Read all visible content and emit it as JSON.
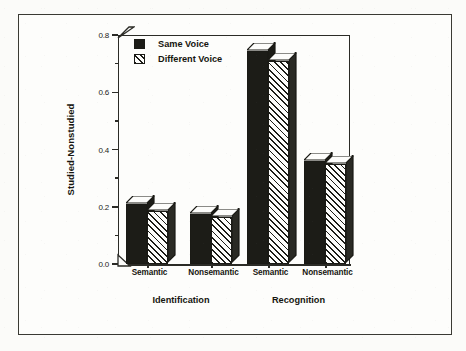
{
  "chart_data": {
    "type": "bar",
    "title": "",
    "xlabel": "",
    "ylabel": "Studied-Nonstudied",
    "ylim": [
      0.0,
      0.8
    ],
    "ytick_labels": [
      "0.0",
      "0.2",
      "0.4",
      "0.6",
      "0.8"
    ],
    "ytick_values": [
      0.0,
      0.2,
      0.4,
      0.6,
      0.8
    ],
    "minor_ticks": [
      0.1,
      0.3,
      0.5,
      0.7
    ],
    "grid": false,
    "legend_position": "top-left-inside",
    "groups": [
      "Identification",
      "Recognition"
    ],
    "categories": [
      "Semantic",
      "Nonsemantic",
      "Semantic",
      "Nonsemantic"
    ],
    "series": [
      {
        "name": "Same Voice",
        "fill": "solid-black",
        "values": [
          0.21,
          0.175,
          0.745,
          0.36
        ]
      },
      {
        "name": "Different Voice",
        "fill": "diagonal-hatch",
        "values": [
          0.185,
          0.165,
          0.71,
          0.35
        ]
      }
    ],
    "bars": [
      {
        "group": "Identification",
        "category": "Semantic",
        "series": "Same Voice",
        "value": 0.21
      },
      {
        "group": "Identification",
        "category": "Semantic",
        "series": "Different Voice",
        "value": 0.185
      },
      {
        "group": "Identification",
        "category": "Nonsemantic",
        "series": "Same Voice",
        "value": 0.175
      },
      {
        "group": "Identification",
        "category": "Nonsemantic",
        "series": "Different Voice",
        "value": 0.165
      },
      {
        "group": "Recognition",
        "category": "Semantic",
        "series": "Same Voice",
        "value": 0.745
      },
      {
        "group": "Recognition",
        "category": "Semantic",
        "series": "Different Voice",
        "value": 0.71
      },
      {
        "group": "Recognition",
        "category": "Nonsemantic",
        "series": "Same Voice",
        "value": 0.36
      },
      {
        "group": "Recognition",
        "category": "Nonsemantic",
        "series": "Different Voice",
        "value": 0.35
      }
    ]
  },
  "axis": {
    "y_title": "Studied-Nonstudied",
    "ticks": [
      {
        "label": "0.8",
        "value": 0.8
      },
      {
        "label": "0.6",
        "value": 0.6
      },
      {
        "label": "0.4",
        "value": 0.4
      },
      {
        "label": "0.2",
        "value": 0.2
      },
      {
        "label": "0.0",
        "value": 0.0
      }
    ]
  },
  "legend": {
    "items": [
      {
        "label": "Same Voice",
        "swatch": "solid-black-swatch"
      },
      {
        "label": "Different Voice",
        "swatch": "hatched-swatch"
      }
    ]
  },
  "categories": [
    {
      "label": "Semantic"
    },
    {
      "label": "Nonsemantic"
    },
    {
      "label": "Semantic"
    },
    {
      "label": "Nonsemantic"
    }
  ],
  "groups": [
    {
      "label": "Identification"
    },
    {
      "label": "Recognition"
    }
  ],
  "colors": {
    "ink": "#1c1c17",
    "frame": "#2b2b26",
    "paper": "#fdfdfb",
    "hatch_bg": "#fdfdfb"
  }
}
